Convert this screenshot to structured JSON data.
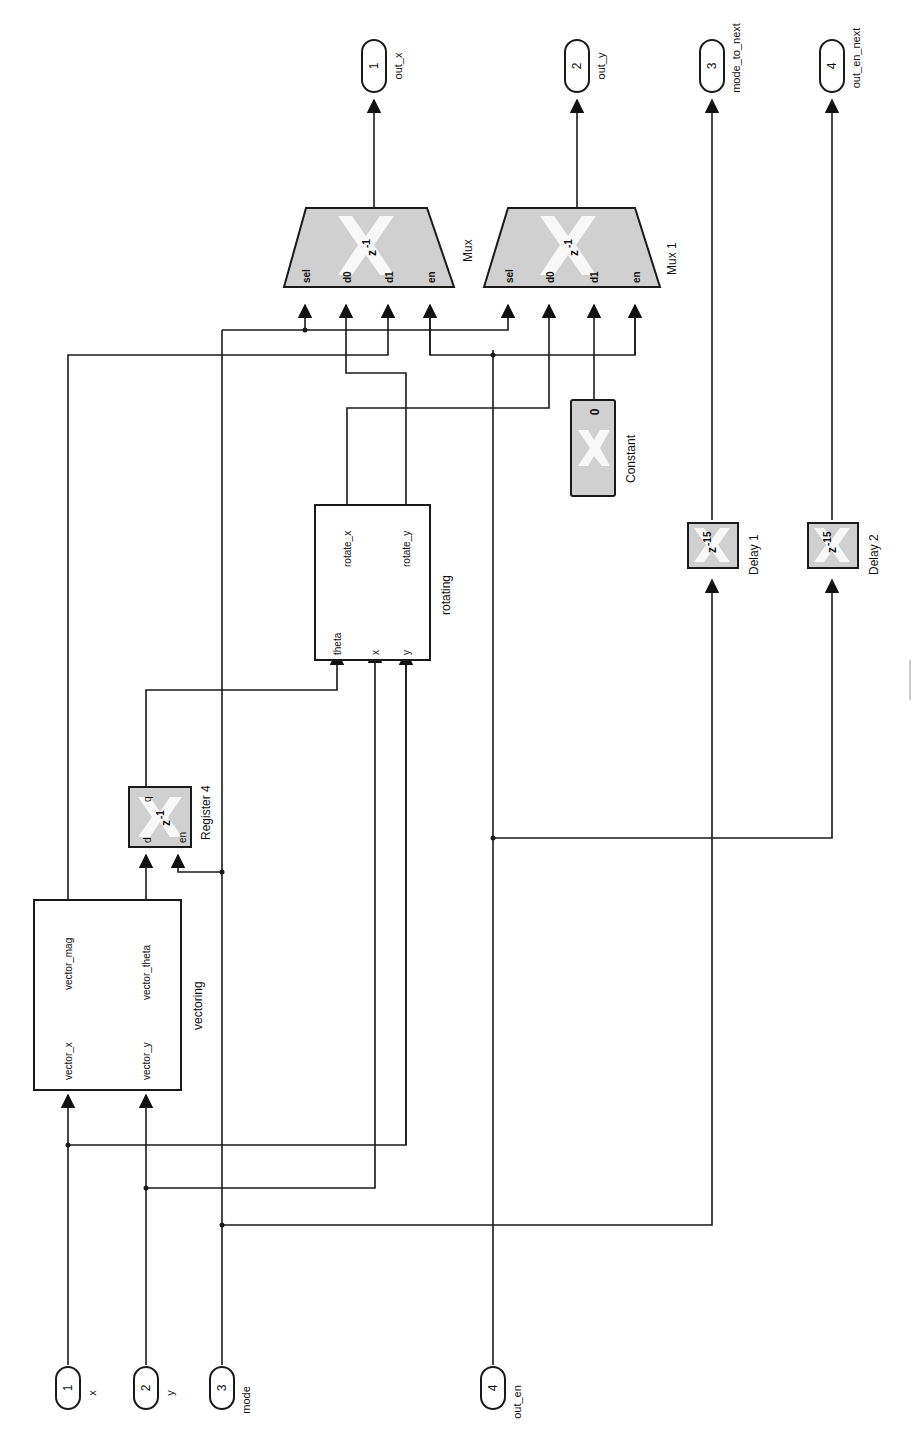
{
  "diagram": {
    "orientation": "rotated-90-ccw",
    "colors": {
      "block_fill": "#d0d0d0",
      "wire": "#1a1a1a",
      "background": "#ffffff"
    },
    "inports": [
      {
        "num": "1",
        "label": "x"
      },
      {
        "num": "2",
        "label": "y"
      },
      {
        "num": "3",
        "label": "mode"
      },
      {
        "num": "4",
        "label": "out_en"
      }
    ],
    "outports": [
      {
        "num": "1",
        "label": "out_x"
      },
      {
        "num": "2",
        "label": "out_y"
      },
      {
        "num": "3",
        "label": "mode_to_next"
      },
      {
        "num": "4",
        "label": "out_en_next"
      }
    ],
    "vectoring": {
      "name": "vectoring",
      "in_ports": [
        "vector_x",
        "vector_y"
      ],
      "out_ports": [
        "vector_mag",
        "vector_theta"
      ]
    },
    "register": {
      "name": "Register 4",
      "ports": {
        "d": "d",
        "en": "en",
        "q": "q"
      },
      "icon_text": "z-1",
      "icon_base": "z",
      "icon_exp": "-1"
    },
    "rotating": {
      "name": "rotating",
      "in_ports": [
        "theta",
        "x",
        "y"
      ],
      "out_ports": [
        "rotate_x",
        "rotate_y"
      ]
    },
    "muxes": [
      {
        "name": "Mux",
        "ports": [
          "sel",
          "d0",
          "d1",
          "en"
        ],
        "icon_base": "z",
        "icon_exp": "-1"
      },
      {
        "name": "Mux 1",
        "ports": [
          "sel",
          "d0",
          "d1",
          "en"
        ],
        "icon_base": "z",
        "icon_exp": "-1"
      }
    ],
    "constant": {
      "name": "Constant",
      "value": "0"
    },
    "delays": [
      {
        "name": "Delay 1",
        "icon_base": "z",
        "icon_exp": "-15"
      },
      {
        "name": "Delay 2",
        "icon_base": "z",
        "icon_exp": "-15"
      }
    ]
  }
}
